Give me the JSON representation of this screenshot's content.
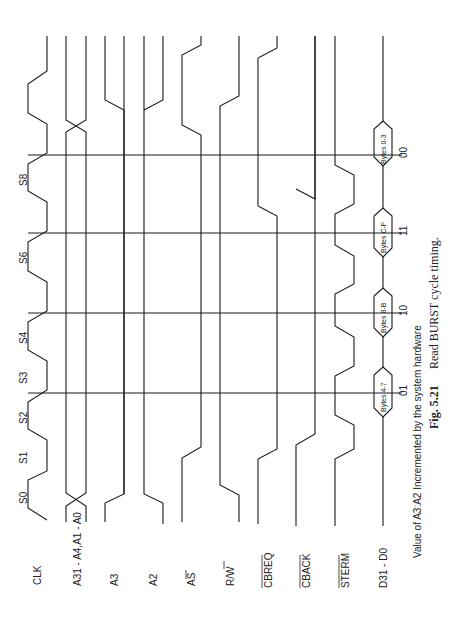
{
  "figure": {
    "number": "Fig. 5.21",
    "title": "Read BURST cycle timing.",
    "note": "Value of A3:A2 Incremented by the system hardware",
    "orientation": "rotated 90deg counter-clockwise"
  },
  "signals": [
    {
      "id": "clk",
      "label": "CLK"
    },
    {
      "id": "addr",
      "label": "A31 - A4,A1 - A0"
    },
    {
      "id": "a3",
      "label": "A3"
    },
    {
      "id": "a2",
      "label": "A2"
    },
    {
      "id": "as",
      "label": "AS",
      "overbar": true
    },
    {
      "id": "rw",
      "label": "R/W",
      "overbar_part": "W"
    },
    {
      "id": "cbreq",
      "label": "CBREQ",
      "overbar": true
    },
    {
      "id": "cback",
      "label": "CBACK",
      "overbar": true
    },
    {
      "id": "sterm",
      "label": "STERM",
      "overbar": true
    },
    {
      "id": "data",
      "label": "D31 - D0"
    }
  ],
  "states": [
    "S0",
    "S1",
    "S2",
    "S3",
    "S4",
    "S6",
    "S8"
  ],
  "data_transfers": [
    {
      "label": "Bytes 4-7",
      "a3a2": "01"
    },
    {
      "label": "Bytes 8-B",
      "a3a2": "10"
    },
    {
      "label": "Bytes C-F",
      "a3a2": "11"
    },
    {
      "label": "Bytes 0-3",
      "a3a2": "00"
    }
  ]
}
